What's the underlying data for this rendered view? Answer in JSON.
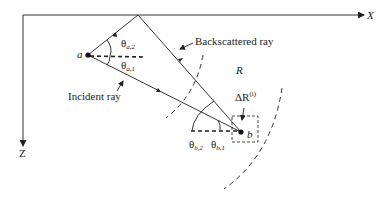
{
  "diagram": {
    "axes": {
      "x_label": "X",
      "z_label": "Z"
    },
    "points": {
      "a": "a",
      "b": "b"
    },
    "angles": {
      "theta_a2": {
        "base": "θ",
        "sub": "a,2"
      },
      "theta_a1": {
        "base": "θ",
        "sub": "a,1"
      },
      "theta_b2": {
        "base": "θ",
        "sub": "b,2"
      },
      "theta_b1": {
        "base": "θ",
        "sub": "b,1"
      }
    },
    "labels": {
      "backscattered_ray": "Backscattered ray",
      "incident_ray": "Incident ray",
      "region": "R",
      "delta_r": {
        "base": "ΔR",
        "sup": "(i)"
      }
    },
    "colors": {
      "line": "#333333",
      "background": "#ffffff"
    }
  }
}
